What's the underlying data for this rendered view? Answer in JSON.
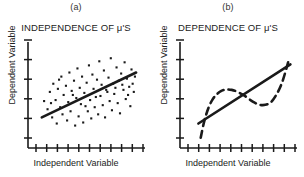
{
  "figure": {
    "background": "#ffffff",
    "ink_color": "#1a1a1a",
    "width": 304,
    "height": 177
  },
  "panels": [
    {
      "key": "a",
      "label": "(a)",
      "title": "INDEPENDENCE OF μ'S",
      "xlabel": "Independent Variable",
      "ylabel": "Dependent Variable"
    },
    {
      "key": "b",
      "label": "(b)",
      "title": "DEPENDENCE OF μ'S",
      "xlabel": "Independent Variable",
      "ylabel": "Dependent Variable"
    }
  ],
  "chart_data": [
    {
      "type": "scatter",
      "panel": "a",
      "title": "INDEPENDENCE OF μ'S",
      "panel_label": "(a)",
      "xlabel": "Independent Variable",
      "ylabel": "Dependent Variable",
      "xlim": [
        0,
        100
      ],
      "ylim": [
        0,
        100
      ],
      "grid": false,
      "legend": null,
      "x_ticks": 11,
      "y_ticks": 6,
      "x_tick_labels": [],
      "y_tick_labels": [],
      "points": [
        [
          14,
          46
        ],
        [
          17,
          38
        ],
        [
          19,
          55
        ],
        [
          21,
          30
        ],
        [
          22,
          63
        ],
        [
          24,
          47
        ],
        [
          25,
          24
        ],
        [
          26,
          58
        ],
        [
          28,
          40
        ],
        [
          29,
          70
        ],
        [
          30,
          33
        ],
        [
          31,
          52
        ],
        [
          33,
          61
        ],
        [
          34,
          27
        ],
        [
          35,
          45
        ],
        [
          36,
          74
        ],
        [
          37,
          36
        ],
        [
          38,
          56
        ],
        [
          40,
          66
        ],
        [
          41,
          22
        ],
        [
          42,
          49
        ],
        [
          43,
          78
        ],
        [
          44,
          31
        ],
        [
          45,
          59
        ],
        [
          46,
          43
        ],
        [
          47,
          70
        ],
        [
          48,
          25
        ],
        [
          49,
          54
        ],
        [
          51,
          64
        ],
        [
          52,
          36
        ],
        [
          53,
          81
        ],
        [
          54,
          47
        ],
        [
          55,
          29
        ],
        [
          56,
          72
        ],
        [
          57,
          58
        ],
        [
          58,
          40
        ],
        [
          60,
          67
        ],
        [
          61,
          33
        ],
        [
          62,
          85
        ],
        [
          63,
          51
        ],
        [
          64,
          62
        ],
        [
          65,
          42
        ],
        [
          66,
          76
        ],
        [
          67,
          30
        ],
        [
          68,
          57
        ],
        [
          70,
          69
        ],
        [
          71,
          46
        ],
        [
          72,
          88
        ],
        [
          73,
          37
        ],
        [
          74,
          63
        ],
        [
          75,
          53
        ],
        [
          77,
          79
        ],
        [
          78,
          44
        ],
        [
          79,
          66
        ],
        [
          80,
          34
        ],
        [
          81,
          73
        ],
        [
          83,
          57
        ],
        [
          84,
          84
        ],
        [
          85,
          48
        ],
        [
          86,
          68
        ],
        [
          88,
          60
        ],
        [
          89,
          41
        ],
        [
          90,
          77
        ],
        [
          92,
          55
        ],
        [
          93,
          70
        ],
        [
          20,
          44
        ],
        [
          27,
          67
        ],
        [
          39,
          52
        ],
        [
          50,
          41
        ],
        [
          59,
          50
        ],
        [
          69,
          55
        ],
        [
          76,
          59
        ],
        [
          82,
          62
        ],
        [
          87,
          52
        ],
        [
          91,
          63
        ]
      ],
      "point_style": {
        "marker": "square",
        "size": 1.4,
        "color": "#1a1a1a"
      },
      "trend_line": {
        "style": "solid",
        "width": 2.6,
        "color": "#1a1a1a",
        "x0": 12,
        "y0": 30,
        "x1": 94,
        "y1": 74
      }
    },
    {
      "type": "line",
      "panel": "b",
      "title": "DEPENDENCE OF μ'S",
      "panel_label": "(b)",
      "xlabel": "Independent Variable",
      "ylabel": "Dependent Variable",
      "xlim": [
        0,
        100
      ],
      "ylim": [
        0,
        100
      ],
      "grid": false,
      "legend": null,
      "x_ticks": 11,
      "y_ticks": 6,
      "x_tick_labels": [],
      "y_tick_labels": [],
      "series": [
        {
          "name": "linear trend",
          "style": "solid",
          "width": 2.6,
          "color": "#1a1a1a",
          "x": [
            16,
            96
          ],
          "y": [
            24,
            82
          ]
        },
        {
          "name": "dependent wave",
          "style": "dashed",
          "width": 2.6,
          "color": "#1a1a1a",
          "dash_pattern": "7 5",
          "x": [
            18,
            22,
            28,
            36,
            45,
            55,
            64,
            72,
            80,
            88,
            94
          ],
          "y": [
            10,
            30,
            47,
            56,
            57,
            52,
            45,
            42,
            46,
            62,
            84
          ]
        }
      ]
    }
  ]
}
